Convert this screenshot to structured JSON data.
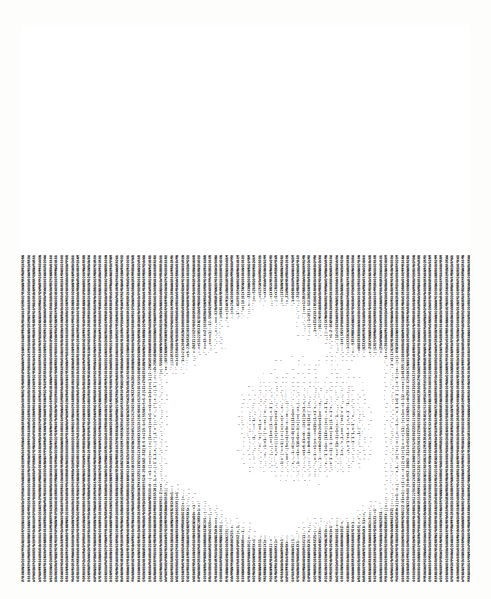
{
  "artwork": {
    "title": "ASCII Art Portrait",
    "medium": "line-printer character art",
    "subject": "human face / head, frontal portrait",
    "orientation": "characters rotated 90 degrees (read bottom-to-top)",
    "background_tone": "dark dense character fill",
    "paper_color": "#fdfdfb",
    "ink_color": "#0a0a0a",
    "plate": {
      "x": 21,
      "y": 25,
      "width": 449,
      "height": 557
    },
    "grid": {
      "columns": 82,
      "rows": 155,
      "col_pitch_px": 5.5,
      "row_pitch_px": 3.6
    }
  },
  "charset": {
    "ramp_dark_to_light": [
      "M",
      "W",
      "N",
      "0",
      "S",
      "2",
      "+",
      "=",
      "1",
      "-",
      ":",
      ".",
      " "
    ],
    "notes": "dense glyphs M/W/N/0 render dark; +, =, 1, -, : render mid; period and space render light"
  },
  "luminance_map": {
    "description": "coarse 16x20 brightness grid of the depicted portrait, 0 = darkest ink, 9 = brightest paper",
    "rows": [
      "0000000000000000",
      "0000000000000000",
      "0000000011000000",
      "0000001399310000",
      "0000013999993100",
      "0000139999999310",
      "0000399998899310",
      "0001399976679310",
      "0001399964469310",
      "0001399954459310",
      "0001399965569310",
      "0001399977779310",
      "0000399988889310",
      "0000139998889100",
      "0000013999931000",
      "0000003999310000",
      "0000000399100000",
      "0000000131000000",
      "0000000000000000",
      "0000000000000000"
    ]
  },
  "regions": [
    {
      "name": "hair-top",
      "tone": "dark"
    },
    {
      "name": "forehead-highlight",
      "tone": "bright"
    },
    {
      "name": "eye-sockets",
      "tone": "mid-dark"
    },
    {
      "name": "nose-bridge",
      "tone": "bright"
    },
    {
      "name": "cheeks",
      "tone": "bright"
    },
    {
      "name": "mouth-shadow",
      "tone": "mid"
    },
    {
      "name": "chin-jawline",
      "tone": "bright-u-shape"
    },
    {
      "name": "neck-shadow",
      "tone": "dark"
    },
    {
      "name": "background-field",
      "tone": "very-dark-vertical-striping"
    }
  ]
}
